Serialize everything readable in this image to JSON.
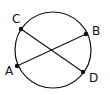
{
  "diagram": {
    "type": "circle-with-intersecting-chords",
    "stroke_color": "#111111",
    "background": "#ffffff",
    "circle": {
      "cx": 53,
      "cy": 50,
      "r": 38
    },
    "points": [
      {
        "id": "C",
        "label": "C",
        "x": 21,
        "y": 29,
        "label_x": 12,
        "label_y": 23
      },
      {
        "id": "B",
        "label": "B",
        "x": 86,
        "y": 34,
        "label_x": 92,
        "label_y": 35
      },
      {
        "id": "A",
        "label": "A",
        "x": 17,
        "y": 66,
        "label_x": 5,
        "label_y": 75
      },
      {
        "id": "D",
        "label": "D",
        "x": 83,
        "y": 72,
        "label_x": 89,
        "label_y": 82
      }
    ],
    "chords": [
      {
        "name": "AB",
        "from": "A",
        "to": "B"
      },
      {
        "name": "CD",
        "from": "C",
        "to": "D"
      }
    ]
  }
}
